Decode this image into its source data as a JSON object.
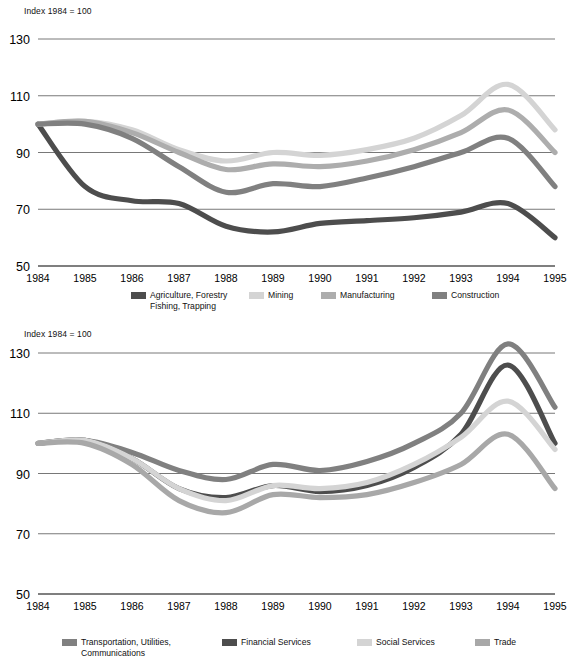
{
  "charts": [
    {
      "id": "industrial-sectors",
      "index_note": "Index 1984 = 100",
      "legend": [
        {
          "label": "Agriculture, Forestry\nFishing, Trapping",
          "color": "#4d4d4d",
          "left": 131,
          "width": 118
        },
        {
          "label": "Mining",
          "color": "#d4d4d4",
          "left": 249,
          "width": 72
        },
        {
          "label": "Manufacturing",
          "color": "#adadad",
          "left": 321,
          "width": 111
        },
        {
          "label": "Construction",
          "color": "#808080",
          "left": 432,
          "width": 100
        }
      ]
    },
    {
      "id": "service-sectors",
      "index_note": "Index  1984 = 100",
      "legend": [
        {
          "label": "Transportation, Utilities,\nCommunications",
          "color": "#808080",
          "left": 62,
          "width": 160
        },
        {
          "label": "Financial Services",
          "color": "#4d4d4d",
          "left": 222,
          "width": 135
        },
        {
          "label": "Social Services",
          "color": "#d4d4d4",
          "left": 357,
          "width": 118
        },
        {
          "label": "Trade",
          "color": "#a8a8a8",
          "left": 475,
          "width": 75
        }
      ]
    }
  ],
  "chart_data": [
    {
      "type": "line",
      "id": "industrial-sectors",
      "title": "",
      "xlabel": "",
      "ylabel": "Index 1984 = 100",
      "ylim": [
        50,
        130
      ],
      "yticks": [
        50,
        70,
        90,
        110,
        130
      ],
      "xlim": [
        1984,
        1995
      ],
      "x": [
        1984,
        1985,
        1986,
        1987,
        1988,
        1989,
        1990,
        1991,
        1992,
        1993,
        1994,
        1995
      ],
      "grid": true,
      "legend_position": "bottom",
      "series": [
        {
          "name": "Agriculture, Forestry Fishing, Trapping",
          "color": "#4d4d4d",
          "values": [
            100,
            78,
            73,
            72,
            64,
            62,
            65,
            66,
            67,
            69,
            72,
            60
          ]
        },
        {
          "name": "Mining",
          "color": "#d4d4d4",
          "values": [
            100,
            101,
            98,
            91,
            87,
            90,
            89,
            91,
            95,
            103,
            114,
            98
          ]
        },
        {
          "name": "Manufacturing",
          "color": "#adadad",
          "values": [
            100,
            101,
            97,
            90,
            84,
            86,
            85,
            87,
            91,
            97,
            105,
            90
          ]
        },
        {
          "name": "Construction",
          "color": "#808080",
          "values": [
            100,
            100,
            95,
            85,
            76,
            79,
            78,
            81,
            85,
            90,
            95,
            78
          ]
        }
      ]
    },
    {
      "type": "line",
      "id": "service-sectors",
      "title": "",
      "xlabel": "",
      "ylabel": "Index  1984 = 100",
      "ylim": [
        50,
        130
      ],
      "yticks": [
        50,
        70,
        90,
        110,
        130
      ],
      "xlim": [
        1984,
        1995
      ],
      "x": [
        1984,
        1985,
        1986,
        1987,
        1988,
        1989,
        1990,
        1991,
        1992,
        1993,
        1994,
        1995
      ],
      "grid": true,
      "legend_position": "bottom",
      "series": [
        {
          "name": "Transportation, Utilities, Communications",
          "color": "#808080",
          "values": [
            100,
            101,
            97,
            91,
            88,
            93,
            91,
            94,
            100,
            110,
            133,
            112
          ]
        },
        {
          "name": "Financial Services",
          "color": "#4d4d4d",
          "values": [
            100,
            101,
            95,
            85,
            82,
            86,
            84,
            86,
            92,
            103,
            126,
            100
          ]
        },
        {
          "name": "Social Services",
          "color": "#d4d4d4",
          "values": [
            100,
            101,
            95,
            85,
            81,
            86,
            85,
            87,
            93,
            102,
            114,
            98
          ]
        },
        {
          "name": "Trade",
          "color": "#a8a8a8",
          "values": [
            100,
            100,
            93,
            81,
            77,
            83,
            82,
            83,
            87,
            93,
            103,
            85
          ]
        }
      ]
    }
  ]
}
